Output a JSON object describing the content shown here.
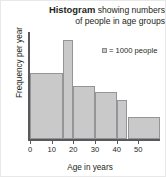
{
  "title": {
    "strong": "Histogram",
    "line1_rest": " showing numbers",
    "line2": "of people in age groups"
  },
  "legend": {
    "swatch_icon": "legend-square-icon",
    "text": "= 1000 people",
    "swatch_color": "#c9c9c9"
  },
  "axes": {
    "ylabel": "Frequency per year",
    "xlabel": "Age in years"
  },
  "chart_data": {
    "type": "bar",
    "title": "Histogram showing numbers of people in age groups",
    "subtitle": "of people in age groups",
    "xlabel": "Age in years",
    "ylabel": "Frequency per year",
    "xlim": [
      0,
      60
    ],
    "ylim": [
      0,
      100
    ],
    "grid": false,
    "legend_position": "upper-right",
    "legend_entries": [
      "= 1000 people"
    ],
    "tick_labels_x": [
      "0",
      "10",
      "20",
      "30",
      "40",
      "50"
    ],
    "tick_values_x": [
      0,
      10,
      20,
      30,
      40,
      50
    ],
    "tick_labels_y": [],
    "bin_edges": [
      0,
      15,
      20,
      30,
      40,
      45,
      60
    ],
    "categories": [
      "0-15",
      "15-20",
      "20-30",
      "30-40",
      "40-45",
      "45-60"
    ],
    "values": [
      62,
      93,
      50,
      44,
      36,
      21
    ],
    "bars": [
      {
        "label": "0-15",
        "x0": 0,
        "x1": 15,
        "height": 62
      },
      {
        "label": "15-20",
        "x0": 15,
        "x1": 20,
        "height": 93
      },
      {
        "label": "20-30",
        "x0": 20,
        "x1": 30,
        "height": 50
      },
      {
        "label": "30-40",
        "x0": 30,
        "x1": 40,
        "height": 44
      },
      {
        "label": "40-45",
        "x0": 40,
        "x1": 45,
        "height": 36
      },
      {
        "label": "45-60",
        "x0": 45,
        "x1": 60,
        "height": 21
      }
    ],
    "bar_fill_color": "#c9c9c9",
    "bar_edge_color": "#939598",
    "axis_color": "#58595b",
    "background_color": "#ffffff"
  }
}
